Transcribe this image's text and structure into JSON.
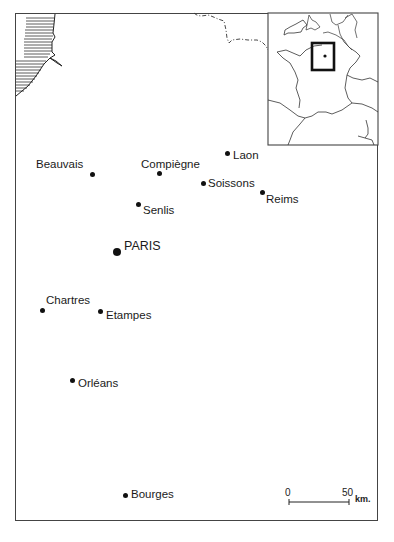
{
  "map": {
    "title": "Paris Basin region",
    "cities": [
      {
        "name": "Laon",
        "dot": [
          227,
          153
        ],
        "label": [
          233,
          149
        ]
      },
      {
        "name": "Beauvais",
        "dot": [
          92,
          174
        ],
        "label": [
          36,
          158
        ]
      },
      {
        "name": "Compiègne",
        "dot": [
          159,
          173
        ],
        "label": [
          141,
          158
        ]
      },
      {
        "name": "Soissons",
        "dot": [
          203,
          183
        ],
        "label": [
          208,
          177
        ]
      },
      {
        "name": "Reims",
        "dot": [
          262,
          192
        ],
        "label": [
          266,
          193
        ]
      },
      {
        "name": "Senlis",
        "dot": [
          138,
          204
        ],
        "label": [
          143,
          204
        ]
      },
      {
        "name": "PARIS",
        "dot": [
          117,
          252
        ],
        "label": [
          124,
          240
        ],
        "capital": true
      },
      {
        "name": "Chartres",
        "dot": [
          42,
          310
        ],
        "label": [
          46,
          294
        ]
      },
      {
        "name": "Etampes",
        "dot": [
          100,
          311
        ],
        "label": [
          106,
          309
        ]
      },
      {
        "name": "Orléans",
        "dot": [
          72,
          380
        ],
        "label": [
          78,
          377
        ]
      },
      {
        "name": "Bourges",
        "dot": [
          125,
          495
        ],
        "label": [
          131,
          488
        ]
      }
    ],
    "scale": {
      "zero": "0",
      "max": "50",
      "unit": "km."
    },
    "inset": {
      "label": "France locator inset"
    },
    "colors": {
      "ink": "#111111",
      "frame": "#444444",
      "background": "#ffffff"
    }
  }
}
